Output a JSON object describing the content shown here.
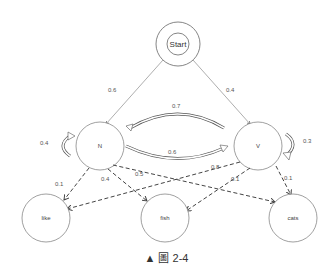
{
  "diagram": {
    "nodes": {
      "start": "Start",
      "n": "N",
      "v": "V",
      "like": "like",
      "fish": "fish",
      "cats": "cats"
    },
    "edges": {
      "start_n": "0.6",
      "start_v": "0.4",
      "n_v": "0.7",
      "v_n": "0.6",
      "n_n": "0.4",
      "v_v": "0.3",
      "n_like": "0.1",
      "n_fish": "0.4",
      "n_cats": "0.5",
      "v_like": "0.8",
      "v_fish": "0.1",
      "v_cats": "0.1"
    }
  },
  "caption": {
    "marker": "▲",
    "text": "圖 2-4"
  }
}
